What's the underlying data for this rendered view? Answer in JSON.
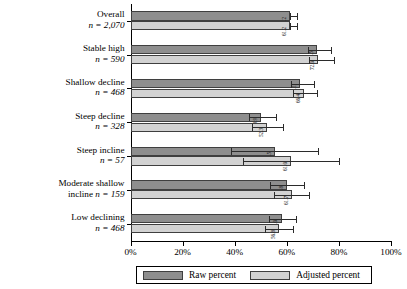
{
  "chart_data": {
    "type": "bar",
    "orientation": "horizontal",
    "title": "",
    "xlabel": "",
    "ylabel": "",
    "xlim": [
      0,
      100
    ],
    "xticks": [
      0,
      20,
      40,
      60,
      80,
      100
    ],
    "xticklabels": [
      "0%",
      "20%",
      "40%",
      "60%",
      "80%",
      "100%"
    ],
    "grid": false,
    "legend_position": "bottom",
    "categories": [
      {
        "label": "Overall",
        "n": "n = 2,070"
      },
      {
        "label": "Stable high",
        "n": "n = 590"
      },
      {
        "label": "Shallow decline",
        "n": "n = 468"
      },
      {
        "label": "Steep decline",
        "n": "n = 328"
      },
      {
        "label": "Steep incline",
        "n": "n = 57"
      },
      {
        "label": "Moderate shallow incline",
        "n": "n = 159"
      },
      {
        "label": "Low declining",
        "n": "n = 468"
      }
    ],
    "series": [
      {
        "name": "Raw percent",
        "color": "#8e8e8e",
        "values": [
          61.2,
          71.5,
          65.0,
          50.0,
          55.5,
          60.0,
          58.0
        ],
        "labels": [
          "61.2",
          "71.5",
          "65.1",
          "48.9",
          "55.5",
          "59.8",
          "58.0"
        ],
        "err_low": [
          61.2,
          68.0,
          61.5,
          45.5,
          38.5,
          53.5,
          53.0
        ],
        "err_high": [
          63.8,
          77.0,
          70.5,
          56.0,
          72.0,
          66.5,
          63.5
        ]
      },
      {
        "name": "Adjusted percent",
        "color": "#d2d2d2",
        "values": [
          61.2,
          72.0,
          66.5,
          52.5,
          61.5,
          62.0,
          57.0
        ],
        "labels": [
          "61.2",
          "72.0",
          "66.4",
          "52.3",
          "61.0",
          "61.7",
          "56.8"
        ],
        "err_low": [
          61.2,
          68.5,
          62.5,
          46.5,
          43.0,
          55.0,
          51.5
        ],
        "err_high": [
          63.8,
          78.0,
          71.5,
          58.5,
          80.0,
          68.5,
          62.5
        ]
      }
    ]
  },
  "legend": {
    "raw_label": "Raw percent",
    "adjusted_label": "Adjusted percent"
  }
}
